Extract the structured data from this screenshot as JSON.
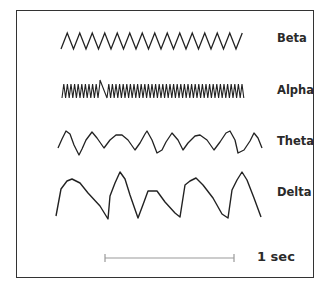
{
  "waves": [
    {
      "name": "Beta",
      "label_top": 33,
      "type": "zigzag",
      "x_start": 61,
      "x_end": 248,
      "y_peak": 33,
      "y_trough": 49,
      "period": 12.5
    },
    {
      "name": "Alpha",
      "label_top": 85,
      "type": "zigzag-spike",
      "x_start": 62,
      "x_end": 245,
      "y_peak": 84,
      "y_trough": 98,
      "period": 3.6,
      "spike": {
        "x": 100,
        "y": 80,
        "x_end": 107
      }
    },
    {
      "name": "Theta",
      "label_top": 136,
      "type": "polyline",
      "points": [
        [
          58,
          148
        ],
        [
          62,
          139
        ],
        [
          66,
          131
        ],
        [
          70,
          134
        ],
        [
          74,
          145
        ],
        [
          79,
          155
        ],
        [
          82,
          149
        ],
        [
          86,
          140
        ],
        [
          92,
          132
        ],
        [
          97,
          138
        ],
        [
          104,
          148
        ],
        [
          110,
          140
        ],
        [
          116,
          135
        ],
        [
          122,
          135
        ],
        [
          128,
          140
        ],
        [
          135,
          150
        ],
        [
          140,
          143
        ],
        [
          145,
          134
        ],
        [
          147,
          131
        ],
        [
          152,
          140
        ],
        [
          157,
          153
        ],
        [
          162,
          150
        ],
        [
          166,
          142
        ],
        [
          172,
          133
        ],
        [
          178,
          140
        ],
        [
          183,
          150
        ],
        [
          188,
          143
        ],
        [
          195,
          136
        ],
        [
          200,
          135
        ],
        [
          207,
          140
        ],
        [
          214,
          150
        ],
        [
          220,
          142
        ],
        [
          226,
          133
        ],
        [
          230,
          131
        ],
        [
          235,
          140
        ],
        [
          238,
          153
        ],
        [
          244,
          150
        ],
        [
          250,
          141
        ],
        [
          254,
          133
        ],
        [
          258,
          138
        ],
        [
          262,
          148
        ]
      ]
    },
    {
      "name": "Delta",
      "label_top": 187,
      "type": "polyline",
      "points": [
        [
          56,
          216
        ],
        [
          61,
          189
        ],
        [
          67,
          181
        ],
        [
          72,
          179
        ],
        [
          80,
          183
        ],
        [
          88,
          193
        ],
        [
          100,
          206
        ],
        [
          108,
          219
        ],
        [
          110,
          196
        ],
        [
          115,
          183
        ],
        [
          120,
          172
        ],
        [
          125,
          179
        ],
        [
          130,
          195
        ],
        [
          138,
          218
        ],
        [
          144,
          202
        ],
        [
          148,
          191
        ],
        [
          157,
          191
        ],
        [
          165,
          202
        ],
        [
          175,
          213
        ],
        [
          180,
          217
        ],
        [
          185,
          185
        ],
        [
          190,
          181
        ],
        [
          196,
          178
        ],
        [
          203,
          185
        ],
        [
          213,
          198
        ],
        [
          222,
          214
        ],
        [
          228,
          218
        ],
        [
          232,
          190
        ],
        [
          237,
          180
        ],
        [
          242,
          172
        ],
        [
          247,
          180
        ],
        [
          254,
          198
        ],
        [
          261,
          217
        ]
      ]
    }
  ],
  "scale_bar": {
    "label": "1 sec",
    "x_start": 105,
    "x_end": 234,
    "y": 258,
    "color": "#999999"
  },
  "colors": {
    "wave": "#222222",
    "frame": "#333333"
  }
}
